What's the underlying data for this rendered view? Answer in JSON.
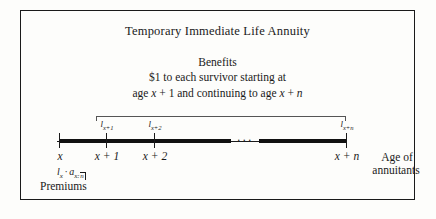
{
  "figure": {
    "title": "Temporary Immediate Life Annuity",
    "benefits_heading": "Benefits",
    "benefit_line_1": "$1 to each survivor starting at",
    "benefit_line_2_pre": "age ",
    "benefit_line_2_var1": "x",
    "benefit_line_2_mid": " + 1 and continuing to age ",
    "benefit_line_2_var2": "x",
    "benefit_line_2_end": " + ",
    "benefit_line_2_var3": "n"
  },
  "timeline": {
    "ellipsis": "···",
    "age_labels": [
      {
        "name": "x",
        "text": "x"
      },
      {
        "name": "x-plus-1",
        "text": "x + 1"
      },
      {
        "name": "x-plus-2",
        "text": "x + 2"
      },
      {
        "name": "x-plus-n",
        "text": "x + n"
      }
    ],
    "survivor_labels": [
      {
        "name": "l-x-plus-1",
        "base": "l",
        "sub": "x+1"
      },
      {
        "name": "l-x-plus-2",
        "base": "l",
        "sub": "x+2"
      },
      {
        "name": "l-x-plus-n",
        "base": "l",
        "sub": "x+n"
      }
    ]
  },
  "premiums": {
    "formula_base": "l",
    "formula_base_sub": "x",
    "formula_operator": "·",
    "formula_annuity": "a",
    "formula_annuity_sub_age": "x",
    "formula_annuity_sub_sep": ":",
    "formula_annuity_sub_term": "n",
    "label": "Premiums"
  },
  "axis_caption": {
    "line_1": "Age of",
    "line_2": "annuitants"
  },
  "colors": {
    "ink": "#1a1a1a",
    "rule": "#555555",
    "background": "#fdfdfb"
  }
}
